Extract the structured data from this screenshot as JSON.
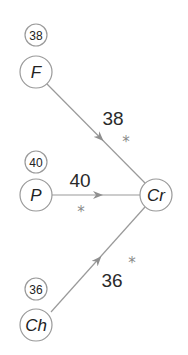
{
  "diagram": {
    "colors": {
      "stroke": "#9a9a9a",
      "text": "#222222",
      "star": "#8a8a8a",
      "background": "#ffffff"
    },
    "target": {
      "id": "Cr",
      "label": "Cr"
    },
    "sources": [
      {
        "id": "F",
        "label": "F",
        "count": "38",
        "edge_value": "38",
        "significance": "*"
      },
      {
        "id": "P",
        "label": "P",
        "count": "40",
        "edge_value": "40",
        "significance": "*"
      },
      {
        "id": "Ch",
        "label": "Ch",
        "count": "36",
        "edge_value": "36",
        "significance": "*"
      }
    ]
  }
}
